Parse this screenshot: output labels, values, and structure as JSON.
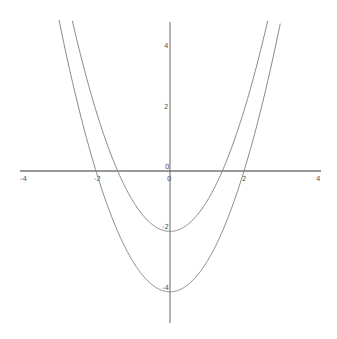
{
  "chart_data": {
    "type": "line",
    "title": "",
    "xlabel": "",
    "ylabel": "",
    "xlim": [
      -4,
      4
    ],
    "ylim": [
      -5,
      5
    ],
    "grid": false,
    "legend": null,
    "x_ticks": [
      "-4",
      "-2",
      "0",
      "2",
      "4"
    ],
    "y_ticks": [
      "4",
      "2",
      "0",
      "-2",
      "-4"
    ],
    "series": [
      {
        "name": "y = x^2 - 2",
        "expression": "x^2 - 2",
        "vertex": [
          0,
          -2
        ],
        "color": "#888888"
      },
      {
        "name": "y = x^2 - 4",
        "expression": "x^2 - 4",
        "vertex": [
          0,
          -4
        ],
        "color": "#888888"
      }
    ]
  },
  "axes": {
    "origin_label": "0",
    "x_tick_labels": [
      {
        "v": -4,
        "label": "-4"
      },
      {
        "v": -2,
        "label": "-2"
      },
      {
        "v": 2,
        "label": "2"
      },
      {
        "v": 4,
        "label": "4"
      }
    ],
    "y_tick_labels": [
      {
        "v": 4,
        "label": "4"
      },
      {
        "v": 2,
        "label": "2"
      },
      {
        "v": -2,
        "label": "-2"
      },
      {
        "v": -4,
        "label": "-4"
      }
    ],
    "axis_color": "#333333",
    "curve_color": "#888888"
  }
}
